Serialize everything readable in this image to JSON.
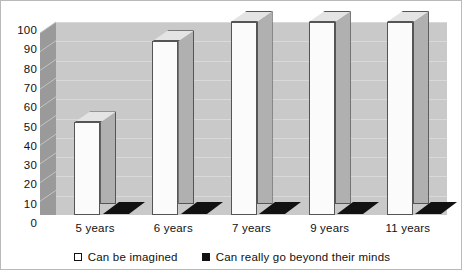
{
  "chart_data": {
    "type": "bar",
    "title": "",
    "subtitle": "",
    "xlabel": "",
    "ylabel": "",
    "categories": [
      "5 years",
      "6 years",
      "7 years",
      "9 years",
      "11 years"
    ],
    "series": [
      {
        "name": "Can be imagined",
        "marker": "hollow-square",
        "color": "#fbfbfb",
        "values": [
          48,
          90,
          100,
          100,
          100
        ]
      },
      {
        "name": "Can really go beyond their minds",
        "marker": "filled-square",
        "color": "#111111",
        "values": [
          0,
          0,
          0,
          0,
          0
        ]
      }
    ],
    "ylim": [
      0,
      100
    ],
    "ytick_step": 10,
    "yticks": [
      "100",
      "90",
      "80",
      "70",
      "60",
      "50",
      "40",
      "30",
      "20",
      "10",
      "0"
    ],
    "grid": true,
    "grid_axis": "y",
    "legend_position": "bottom",
    "style": "3d-columns",
    "plot_background": "#c9c9c9",
    "side_wall_color": "#9a9a9a",
    "frame_color": "#b9b9b9"
  },
  "legend": {
    "items": [
      {
        "label": "Can be imagined",
        "marker": "hollow-square"
      },
      {
        "label": "Can really go beyond their minds",
        "marker": "filled-square"
      }
    ]
  }
}
